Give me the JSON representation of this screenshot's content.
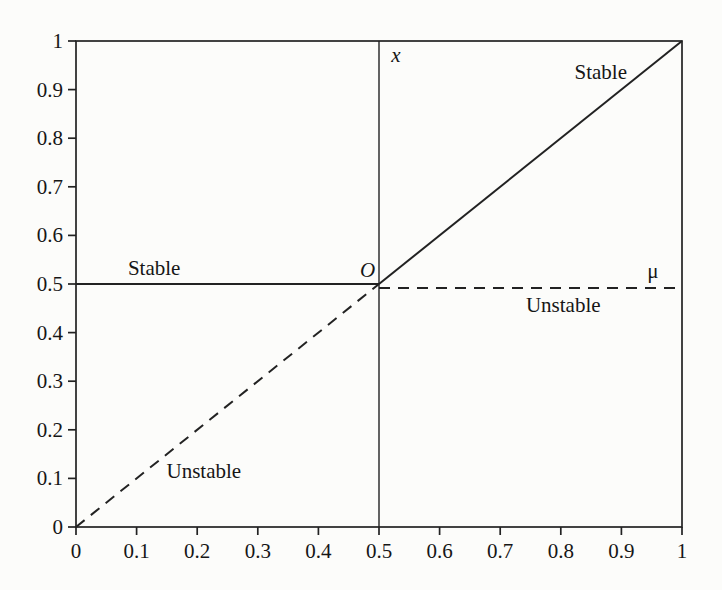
{
  "figure": {
    "background": "#fcfcfa",
    "line_color": "#222222",
    "text_color": "#161616"
  },
  "chart_data": {
    "type": "line",
    "title": "",
    "xlabel": "μ",
    "ylabel": "x",
    "xlim": [
      0,
      1
    ],
    "ylim": [
      0,
      1
    ],
    "grid": false,
    "legend_position": "none",
    "xtick_values": [
      0,
      0.1,
      0.2,
      0.3,
      0.4,
      0.5,
      0.6,
      0.7,
      0.8,
      0.9,
      1
    ],
    "xtick_labels": [
      "0",
      "0.1",
      "0.2",
      "0.3",
      "0.4",
      "0.5",
      "0.6",
      "0.7",
      "0.8",
      "0.9",
      "1"
    ],
    "ytick_values": [
      0,
      0.1,
      0.2,
      0.3,
      0.4,
      0.5,
      0.6,
      0.7,
      0.8,
      0.9,
      1
    ],
    "ytick_labels": [
      "0",
      "0.1",
      "0.2",
      "0.3",
      "0.4",
      "0.5",
      "0.6",
      "0.7",
      "0.8",
      "0.9",
      "1"
    ],
    "series": [
      {
        "name": "stable-branch-left-horizontal",
        "label": "Stable",
        "style": "solid",
        "points": [
          [
            0,
            0.5
          ],
          [
            0.5,
            0.5
          ]
        ]
      },
      {
        "name": "unstable-branch-right-horizontal",
        "label": "Unstable",
        "style": "dashed",
        "points": [
          [
            0.5,
            0.492
          ],
          [
            1,
            0.492
          ]
        ]
      },
      {
        "name": "unstable-branch-lower-diagonal",
        "label": "Unstable",
        "style": "dashed",
        "points": [
          [
            0,
            0
          ],
          [
            0.5,
            0.5
          ]
        ]
      },
      {
        "name": "stable-branch-upper-diagonal",
        "label": "Stable",
        "style": "solid",
        "points": [
          [
            0.5,
            0.5
          ],
          [
            1,
            1
          ]
        ]
      }
    ],
    "reference_lines": [
      {
        "name": "x-axis-vertical-line",
        "orientation": "vertical",
        "at": 0.5
      }
    ],
    "annotations": [
      {
        "name": "stable-label-left",
        "text": "Stable",
        "x": 0.129,
        "y": 0.533,
        "italic": false
      },
      {
        "name": "unstable-label-lower",
        "text": "Unstable",
        "x": 0.211,
        "y": 0.115,
        "italic": false
      },
      {
        "name": "origin-label",
        "text": "O",
        "x": 0.481,
        "y": 0.529,
        "italic": true
      },
      {
        "name": "x-axis-label",
        "text": "x",
        "x": 0.528,
        "y": 0.972,
        "italic": true
      },
      {
        "name": "stable-label-upper-right",
        "text": "Stable",
        "x": 0.866,
        "y": 0.936,
        "italic": false
      },
      {
        "name": "mu-axis-label",
        "text": "μ",
        "x": 0.952,
        "y": 0.527,
        "italic": false
      },
      {
        "name": "unstable-label-right",
        "text": "Unstable",
        "x": 0.804,
        "y": 0.457,
        "italic": false
      }
    ]
  }
}
